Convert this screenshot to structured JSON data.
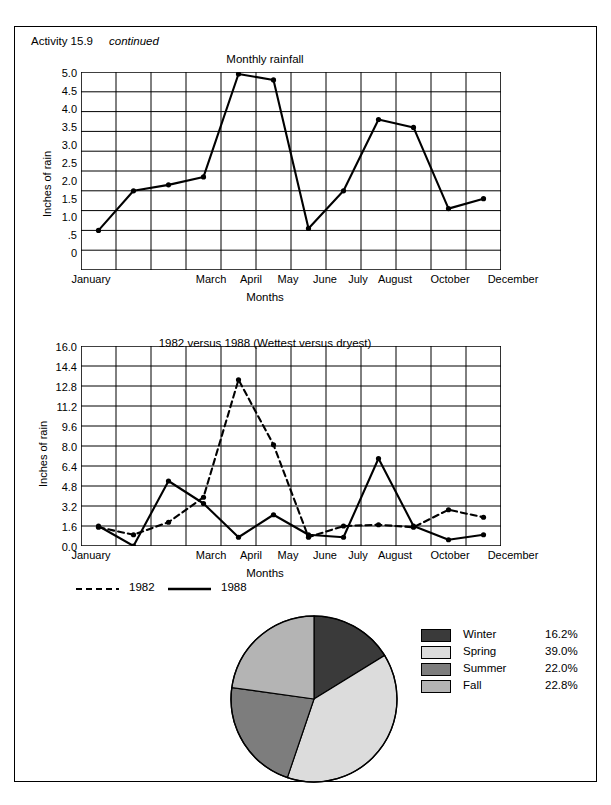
{
  "header": {
    "activity": "Activity 15.9",
    "continued": "continued"
  },
  "chart_data": [
    {
      "type": "line",
      "title": "Monthly rainfall",
      "xlabel": "Months",
      "ylabel": "Inches of rain",
      "ylim": [
        0,
        5.0
      ],
      "grid": true,
      "yticks": [
        "0",
        ".5",
        "1.0",
        "1.5",
        "2.0",
        "2.5",
        "3.0",
        "3.5",
        "4.0",
        "4.5",
        "5.0"
      ],
      "ytick_values": [
        0,
        0.5,
        1.0,
        1.5,
        2.0,
        2.5,
        3.0,
        3.5,
        4.0,
        4.5,
        5.0
      ],
      "categories": [
        "January",
        "February",
        "March",
        "April",
        "May",
        "June",
        "July",
        "August",
        "September",
        "October",
        "November",
        "December"
      ],
      "xtick_labels": [
        "January",
        "",
        "March",
        "April",
        "May",
        "June",
        "July",
        "August",
        "",
        "October",
        "",
        "December"
      ],
      "values": [
        1.0,
        2.0,
        2.15,
        2.35,
        4.95,
        4.8,
        1.05,
        2.0,
        3.8,
        3.6,
        1.55,
        1.8
      ],
      "legend": []
    },
    {
      "type": "line",
      "title": "1982 versus 1988 (Wettest versus dryest)",
      "xlabel": "Months",
      "ylabel": "Inches of rain",
      "ylim": [
        0.0,
        16.0
      ],
      "grid": true,
      "yticks": [
        "0.0",
        "1.6",
        "3.2",
        "4.8",
        "6.4",
        "8.0",
        "9.6",
        "11.2",
        "12.8",
        "14.4",
        "16.0"
      ],
      "ytick_values": [
        0.0,
        1.6,
        3.2,
        4.8,
        6.4,
        8.0,
        9.6,
        11.2,
        12.8,
        14.4,
        16.0
      ],
      "categories": [
        "January",
        "February",
        "March",
        "April",
        "May",
        "June",
        "July",
        "August",
        "September",
        "October",
        "November",
        "December"
      ],
      "xtick_labels": [
        "January",
        "",
        "March",
        "April",
        "May",
        "June",
        "July",
        "August",
        "",
        "October",
        "",
        "December"
      ],
      "series": [
        {
          "name": "1982",
          "style": "dashed",
          "values": [
            1.5,
            0.9,
            1.9,
            3.9,
            13.3,
            8.1,
            0.7,
            1.6,
            1.7,
            1.5,
            2.9,
            2.3
          ]
        },
        {
          "name": "1988",
          "style": "solid",
          "values": [
            1.6,
            0.0,
            5.2,
            3.4,
            0.7,
            2.5,
            0.9,
            0.7,
            7.0,
            1.6,
            0.5,
            0.9
          ]
        }
      ],
      "legend": [
        {
          "label": "1982",
          "style": "dashed"
        },
        {
          "label": "1988",
          "style": "solid"
        }
      ],
      "legend_position": "below"
    },
    {
      "type": "pie",
      "title": "",
      "labels": [
        "Winter",
        "Spring",
        "Summer",
        "Fall"
      ],
      "values": [
        16.2,
        39.0,
        22.0,
        22.8
      ],
      "value_labels": [
        "16.2%",
        "39.0%",
        "22.0%",
        "22.8%"
      ],
      "colors": [
        "#3a3a3a",
        "#dcdcdc",
        "#7d7d7d",
        "#b4b4b4"
      ],
      "legend_position": "right"
    }
  ]
}
